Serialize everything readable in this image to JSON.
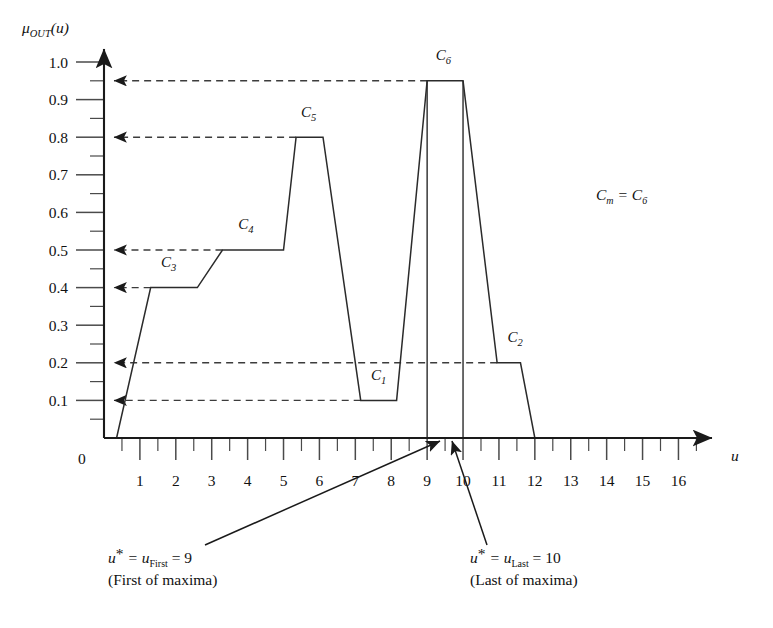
{
  "figure": {
    "y_axis_label": "μ",
    "y_axis_label_sub": "OUT",
    "y_axis_label_arg": "(u)",
    "x_axis_label": "u",
    "origin_label": "0"
  },
  "annotations": {
    "cm_left": "C",
    "cm_sub": "m",
    "cm_eq": " = C",
    "cm_rsub": "6",
    "first": {
      "line1_a": "u",
      "line1_star": "*",
      "line1_b": " = u",
      "line1_sub": "First",
      "line1_c": " = 9",
      "line2": "(First of maxima)"
    },
    "last": {
      "line1_a": "u",
      "line1_star": "*",
      "line1_b": " = u",
      "line1_sub": "Last",
      "line1_c": " = 10",
      "line2": "(Last of maxima)"
    }
  },
  "chart_data": {
    "type": "line",
    "title": "",
    "xlabel": "u",
    "ylabel": "μ_OUT(u)",
    "xlim": [
      0,
      16.6
    ],
    "ylim": [
      0,
      1.05
    ],
    "grid": false,
    "legend": false,
    "x_ticks_major": [
      0,
      1,
      2,
      3,
      4,
      5,
      6,
      7,
      8,
      9,
      10,
      11,
      12,
      13,
      14,
      15,
      16
    ],
    "x_tick_labels": [
      "1",
      "2",
      "3",
      "4",
      "5",
      "6",
      "7",
      "8",
      "9",
      "10",
      "11",
      "12",
      "13",
      "14",
      "15",
      "16"
    ],
    "x_ticks_minor": [
      0.5,
      1.5,
      2.5,
      3.5,
      4.5,
      5.5,
      6.5,
      7.5,
      8.5,
      9.5,
      10.5,
      11.5,
      12.5,
      13.5,
      14.5,
      15.5,
      16.5
    ],
    "y_ticks_major": [
      0.1,
      0.2,
      0.3,
      0.4,
      0.5,
      0.6,
      0.7,
      0.8,
      0.9,
      1.0
    ],
    "y_tick_labels": [
      "0.1",
      "0.2",
      "0.3",
      "0.4",
      "0.5",
      "0.6",
      "0.7",
      "0.8",
      "0.9",
      "1.0"
    ],
    "y_ticks_minor": [
      0.05,
      0.15,
      0.25,
      0.35,
      0.45,
      0.55,
      0.65,
      0.75,
      0.85,
      0.95
    ],
    "membership_curve": [
      [
        0.35,
        0.0
      ],
      [
        1.3,
        0.4
      ],
      [
        2.6,
        0.4
      ],
      [
        3.3,
        0.5
      ],
      [
        5.0,
        0.5
      ],
      [
        5.35,
        0.8
      ],
      [
        6.1,
        0.8
      ],
      [
        7.15,
        0.1
      ],
      [
        8.15,
        0.1
      ],
      [
        9.0,
        0.95
      ],
      [
        10.0,
        0.95
      ],
      [
        10.95,
        0.2
      ],
      [
        11.6,
        0.2
      ],
      [
        12.0,
        0.0
      ]
    ],
    "clusters": [
      {
        "name": "C",
        "sub": "1",
        "x": 7.7,
        "y": 0.1,
        "label_x": 7.65,
        "label_y": 0.155
      },
      {
        "name": "C",
        "sub": "2",
        "x": 11.3,
        "y": 0.2,
        "label_x": 11.45,
        "label_y": 0.255
      },
      {
        "name": "C",
        "sub": "3",
        "x": 1.95,
        "y": 0.4,
        "label_x": 1.8,
        "label_y": 0.455
      },
      {
        "name": "C",
        "sub": "4",
        "x": 4.15,
        "y": 0.5,
        "label_x": 3.95,
        "label_y": 0.555
      },
      {
        "name": "C",
        "sub": "5",
        "x": 5.7,
        "y": 0.8,
        "label_x": 5.7,
        "label_y": 0.855
      },
      {
        "name": "C",
        "sub": "6",
        "x": 9.5,
        "y": 0.95,
        "label_x": 9.45,
        "label_y": 1.005
      }
    ],
    "leader_levels": [
      0.95,
      0.8,
      0.5,
      0.4,
      0.2,
      0.1
    ],
    "leader_ends": [
      {
        "y": 0.95,
        "x": 9.0
      },
      {
        "y": 0.8,
        "x": 5.35
      },
      {
        "y": 0.5,
        "x": 3.3
      },
      {
        "y": 0.4,
        "x": 1.3
      },
      {
        "y": 0.2,
        "x": 10.95
      },
      {
        "y": 0.1,
        "x": 7.15
      }
    ],
    "droplines": [
      {
        "x": 9.0,
        "y_top": 0.95
      },
      {
        "x": 10.0,
        "y_top": 0.95
      }
    ],
    "markers": [
      {
        "label": "u_First",
        "x": 9,
        "value": 9
      },
      {
        "label": "u_Last",
        "x": 10,
        "value": 10
      }
    ]
  }
}
